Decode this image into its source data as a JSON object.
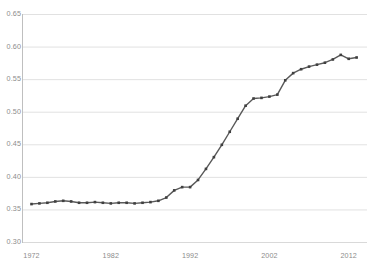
{
  "chart_data": {
    "type": "line",
    "title": "",
    "subtitle": "",
    "xlabel": "",
    "ylabel": "",
    "xlim": [
      1972,
      2014
    ],
    "ylim": [
      0.3,
      0.65
    ],
    "grid": true,
    "grid_axis": "y",
    "legend": false,
    "legend_position": "none",
    "line_color": "#595959",
    "marker": "square",
    "marker_color": "#404040",
    "gridline_color": "#d9d9d9",
    "axis_color": "#bfbfbf",
    "tick_label_color": "#8c8c8c",
    "background_color": "#ffffff",
    "ytick_labels": [
      "0.65",
      "0.60",
      "0.55",
      "0.50",
      "0.45",
      "0.40",
      "0.35",
      "0.30"
    ],
    "ytick_values": [
      0.65,
      0.6,
      0.55,
      0.5,
      0.45,
      0.4,
      0.35,
      0.3
    ],
    "xtick_labels": [
      "1972",
      "1982",
      "1992",
      "2002",
      "2012"
    ],
    "xtick_values": [
      1972,
      1982,
      1992,
      2002,
      2012
    ],
    "series": [
      {
        "name": "series-1",
        "x": [
          1972,
          1973,
          1974,
          1975,
          1976,
          1977,
          1978,
          1979,
          1980,
          1981,
          1982,
          1983,
          1984,
          1985,
          1986,
          1987,
          1988,
          1989,
          1990,
          1991,
          1992,
          1993,
          1994,
          1995,
          1996,
          1997,
          1998,
          1999,
          2000,
          2001,
          2002,
          2003,
          2004,
          2005,
          2006,
          2007,
          2008,
          2009,
          2010,
          2011,
          2012,
          2013
        ],
        "y": [
          0.359,
          0.36,
          0.361,
          0.363,
          0.364,
          0.363,
          0.361,
          0.361,
          0.362,
          0.361,
          0.36,
          0.361,
          0.361,
          0.36,
          0.361,
          0.362,
          0.364,
          0.369,
          0.38,
          0.385,
          0.385,
          0.396,
          0.413,
          0.431,
          0.45,
          0.47,
          0.49,
          0.51,
          0.521,
          0.522,
          0.524,
          0.527,
          0.549,
          0.56,
          0.566,
          0.57,
          0.573,
          0.576,
          0.581,
          0.588,
          0.582,
          0.584
        ]
      }
    ]
  }
}
